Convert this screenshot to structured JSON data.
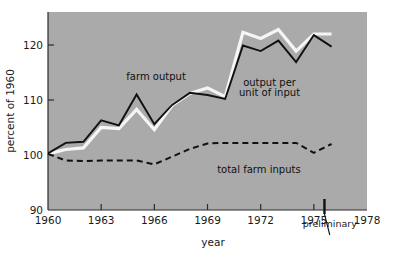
{
  "chart_data": {
    "type": "line",
    "title": "",
    "xlabel": "year",
    "ylabel": "percent of 1960",
    "xlim": [
      1960,
      1978
    ],
    "ylim": [
      90,
      126
    ],
    "ytick_labels": [
      "90",
      "100",
      "110",
      "120"
    ],
    "ytick_values": [
      90,
      100,
      110,
      120
    ],
    "xtick_labels": [
      "1960",
      "1963",
      "1966",
      "1969",
      "1972",
      "1975",
      "1978"
    ],
    "xtick_values": [
      1960,
      1963,
      1966,
      1969,
      1972,
      1975,
      1978
    ],
    "grid": false,
    "legend_position": "inline-annotations",
    "plot_background_color": "#aaaaaa",
    "x": [
      1960,
      1961,
      1962,
      1963,
      1964,
      1965,
      1966,
      1967,
      1968,
      1969,
      1970,
      1971,
      1972,
      1973,
      1974,
      1975,
      1976
    ],
    "series": [
      {
        "name": "farm output",
        "style": "solid-white",
        "color": "#f5f5f5",
        "values": [
          100.2,
          101.0,
          101.3,
          105.0,
          104.8,
          108.3,
          104.6,
          109.0,
          111.2,
          112.2,
          110.6,
          122.3,
          121.2,
          122.8,
          118.9,
          122.0,
          122.0
        ]
      },
      {
        "name": "output per unit of input",
        "style": "solid-black",
        "color": "#111111",
        "values": [
          100.3,
          102.2,
          102.4,
          106.3,
          105.4,
          111.0,
          105.6,
          109.1,
          111.3,
          110.9,
          110.2,
          119.9,
          118.9,
          120.8,
          116.9,
          121.8,
          119.7
        ]
      },
      {
        "name": "total farm inputs",
        "style": "dashed-black",
        "color": "#111111",
        "values": [
          100.2,
          99.0,
          98.9,
          99.0,
          99.0,
          99.0,
          98.3,
          99.7,
          101.1,
          102.1,
          102.2,
          102.2,
          102.2,
          102.2,
          102.2,
          100.4,
          102.0
        ]
      }
    ],
    "annotations": [
      {
        "text": "farm output",
        "x": 1966.1,
        "y": 113.6
      },
      {
        "text": "output per",
        "x": 1972.5,
        "y": 112.5
      },
      {
        "text": "unit of input",
        "x": 1972.5,
        "y": 110.7
      },
      {
        "text": "total farm inputs",
        "x": 1971.9,
        "y": 96.8
      },
      {
        "text": "preliminary",
        "x": 1975.9,
        "y": 87.0
      }
    ]
  },
  "marker": {
    "preliminary_label": "preliminary",
    "preliminary_year": 1975.6
  },
  "colors": {
    "plot_background": "#aaaaaa",
    "page_background": "#ffffff",
    "line_black": "#111111",
    "line_white": "#f5f5f5",
    "axis": "#1a1a1a",
    "text": "#1a1a1a"
  }
}
